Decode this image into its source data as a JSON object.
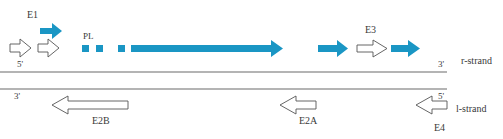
{
  "labels": {
    "e1": "E1",
    "pl": "PL",
    "e3": "E3",
    "e2b": "E2B",
    "e2a": "E2A",
    "e4": "E4",
    "r_strand": "r-strand",
    "l_strand": "l-strand",
    "r_5prime": "5'",
    "r_3prime": "3'",
    "l_3prime": "3'",
    "l_5prime": "5'"
  },
  "colors": {
    "transcript": "#1a96c4",
    "outline": "#555555",
    "strand_line": "#6a6a6a"
  }
}
